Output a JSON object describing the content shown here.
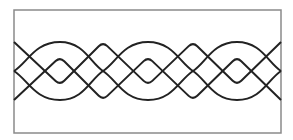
{
  "canvas": {
    "width": 293,
    "height": 140,
    "background": "#ffffff"
  },
  "frame": {
    "x": 14,
    "y": 10,
    "width": 267,
    "height": 123,
    "stroke": "#8a8a8a",
    "stroke_width": 1.5
  },
  "curves": [
    {
      "name": "smooth-wave-upper",
      "kind": "smooth",
      "stroke": "#222222",
      "stroke_width": 2,
      "points": [
        [
          14,
          71
        ],
        [
          60,
          42
        ],
        [
          103,
          71
        ],
        [
          148,
          100
        ],
        [
          193,
          71
        ],
        [
          237,
          42
        ],
        [
          281,
          71
        ]
      ]
    },
    {
      "name": "smooth-wave-lower",
      "kind": "smooth",
      "stroke": "#222222",
      "stroke_width": 2,
      "points": [
        [
          14,
          71
        ],
        [
          60,
          100
        ],
        [
          103,
          71
        ],
        [
          148,
          42
        ],
        [
          193,
          71
        ],
        [
          237,
          100
        ],
        [
          281,
          71
        ]
      ]
    },
    {
      "name": "zigzag-wave-upper",
      "kind": "rounded-zigzag",
      "stroke": "#222222",
      "stroke_width": 2,
      "points": [
        [
          14,
          42
        ],
        [
          60,
          85
        ],
        [
          103,
          42
        ],
        [
          148,
          85
        ],
        [
          193,
          42
        ],
        [
          237,
          85
        ],
        [
          281,
          42
        ]
      ]
    },
    {
      "name": "zigzag-wave-lower",
      "kind": "rounded-zigzag",
      "stroke": "#222222",
      "stroke_width": 2,
      "points": [
        [
          14,
          100
        ],
        [
          60,
          57
        ],
        [
          103,
          100
        ],
        [
          148,
          57
        ],
        [
          193,
          100
        ],
        [
          237,
          57
        ],
        [
          281,
          100
        ]
      ]
    }
  ]
}
